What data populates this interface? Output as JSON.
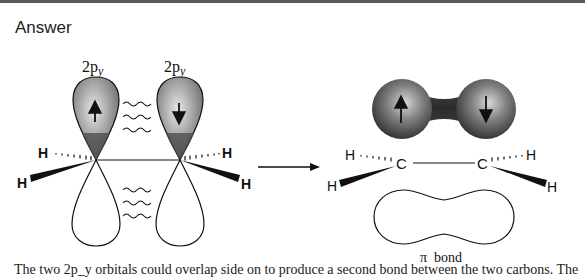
{
  "header": {
    "title": "Answer"
  },
  "left_diagram": {
    "orbital_labels": [
      "2p",
      "2p"
    ],
    "orbital_subscript": "y",
    "atoms": {
      "hydrogen": "H"
    },
    "left_spin": "up",
    "right_spin": "down"
  },
  "reaction_arrow": {
    "icon": "right-arrow-icon"
  },
  "right_diagram": {
    "carbon": "C",
    "hydrogen": "H",
    "bond_label": "π  bond",
    "left_spin": "up",
    "right_spin": "down"
  },
  "caption": {
    "text": "The two 2p_y orbitals could overlap side on to produce a second bond between the two carbons. The"
  },
  "colors": {
    "lobe_shaded": "#8a8a8a",
    "lobe_dark": "#3a3a3a",
    "line": "#111111",
    "topline": "#5a5a5a"
  }
}
